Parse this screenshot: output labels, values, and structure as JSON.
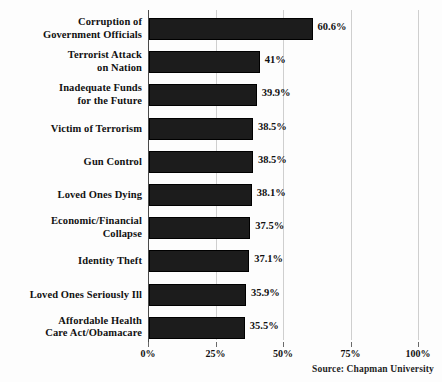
{
  "chart_data": {
    "type": "bar",
    "orientation": "horizontal",
    "title": "",
    "xlabel": "",
    "ylabel": "",
    "xlim": [
      0,
      100
    ],
    "grid": true,
    "legend": false,
    "categories": [
      "Corruption of Government Officials",
      "Terrorist Attack on Nation",
      "Inadequate Funds for the Future",
      "Victim of Terrorism",
      "Gun Control",
      "Loved Ones Dying",
      "Economic/Financial Collapse",
      "Identity Theft",
      "Loved Ones Seriously Ill",
      "Affordable Health Care Act/Obamacare"
    ],
    "category_lines": [
      [
        "Corruption of",
        "Government Officials"
      ],
      [
        "Terrorist Attack",
        "on Nation"
      ],
      [
        "Inadequate Funds",
        "for the Future"
      ],
      [
        "Victim of Terrorism"
      ],
      [
        "Gun Control"
      ],
      [
        "Loved Ones Dying"
      ],
      [
        "Economic/Financial",
        "Collapse"
      ],
      [
        "Identity Theft"
      ],
      [
        "Loved Ones Seriously Ill"
      ],
      [
        "Affordable Health",
        "Care Act/Obamacare"
      ]
    ],
    "values": [
      60.6,
      41,
      39.9,
      38.5,
      38.5,
      38.1,
      37.5,
      37.1,
      35.9,
      35.5
    ],
    "value_labels": [
      "60.6%",
      "41%",
      "39.9%",
      "38.5%",
      "38.5%",
      "38.1%",
      "37.5%",
      "37.1%",
      "35.9%",
      "35.5%"
    ],
    "tick_values": [
      0,
      25,
      50,
      75,
      100
    ],
    "tick_labels": [
      "0%",
      "25%",
      "50%",
      "75%",
      "100%"
    ],
    "bar_color": "#1c1c1c",
    "grid_color": "#cfcfcf",
    "axis_color": "#4a4a4a",
    "background_color": "#fdfdfd"
  },
  "footer": {
    "source": "Source:  Chapman University"
  }
}
